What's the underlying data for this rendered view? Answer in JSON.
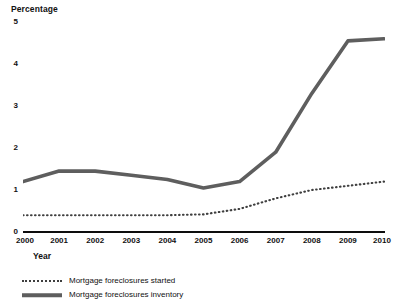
{
  "chart_data": {
    "type": "line",
    "title": "",
    "ylabel": "Percentage",
    "xlabel": "Year",
    "categories": [
      "2000",
      "2001",
      "2002",
      "2003",
      "2004",
      "2005",
      "2006",
      "2007",
      "2008",
      "2009",
      "2010"
    ],
    "x": [
      2000,
      2001,
      2002,
      2003,
      2004,
      2005,
      2006,
      2007,
      2008,
      2009,
      2010
    ],
    "ylim": [
      0,
      5
    ],
    "xlim": [
      2000,
      2010
    ],
    "yticks": [
      0,
      1,
      2,
      3,
      4,
      5
    ],
    "ytick_labels": [
      "0",
      "1",
      "2",
      "3",
      "4",
      "5"
    ],
    "grid": false,
    "legend_position": "bottom-left",
    "series": [
      {
        "name": "Mortgage foreclosures started",
        "style": "dotted",
        "color": "#3f3f3f",
        "values": [
          0.4,
          0.4,
          0.4,
          0.4,
          0.4,
          0.42,
          0.55,
          0.8,
          1.0,
          1.1,
          1.2
        ]
      },
      {
        "name": "Mortgage foreclosures inventory",
        "style": "solid",
        "color": "#5e5e5e",
        "values": [
          1.2,
          1.45,
          1.45,
          1.35,
          1.25,
          1.05,
          1.2,
          1.9,
          3.3,
          4.55,
          4.6
        ]
      }
    ]
  },
  "axes": {
    "y_title": "Percentage",
    "x_title": "Year"
  },
  "legend": {
    "items": [
      {
        "label": "Mortgage foreclosures started",
        "style": "dotted"
      },
      {
        "label": "Mortgage foreclosures inventory",
        "style": "solid"
      }
    ]
  },
  "colors": {
    "axis": "#0d0d0d",
    "series_dotted": "#3f3f3f",
    "series_solid": "#5e5e5e",
    "background": "#ffffff",
    "text": "#111111"
  }
}
